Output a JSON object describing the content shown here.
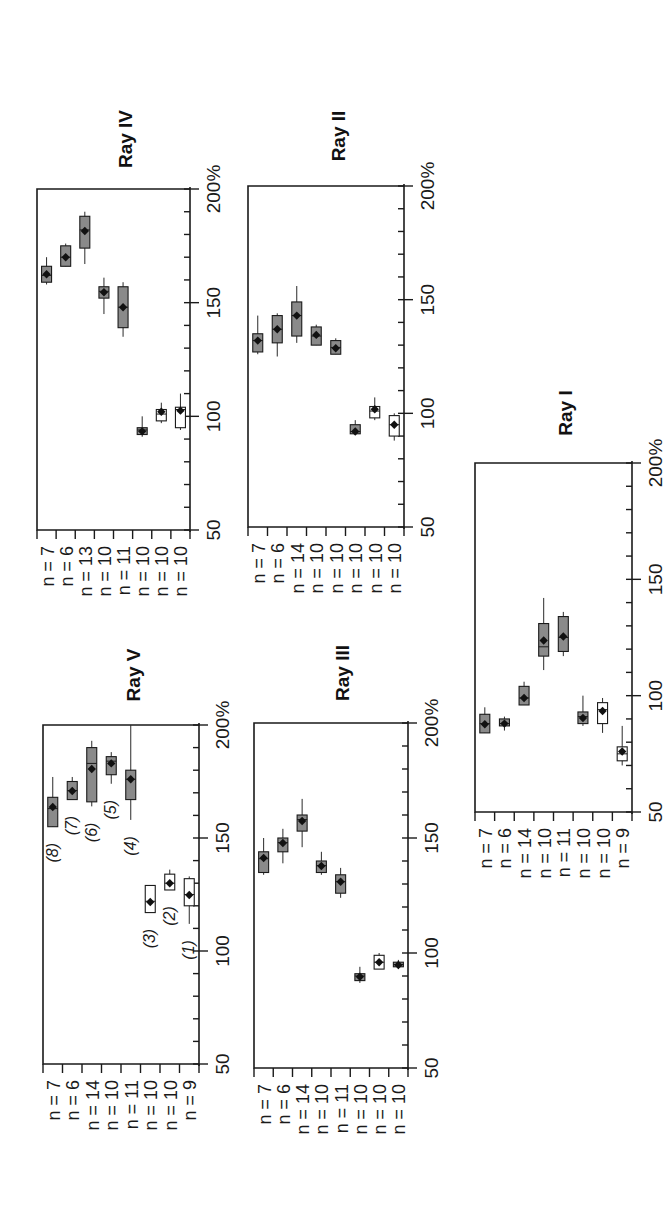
{
  "figure": {
    "orientation": "rotated 90 degrees counter-clockwise",
    "x_axis_ticks": [
      "50",
      "100",
      "150",
      "200%"
    ],
    "colors": {
      "dark_box": "#8a8a8a",
      "light_box": "#ffffff",
      "line": "#1a1a1a"
    }
  },
  "chart_data": [
    {
      "type": "box",
      "title": "Ray IV",
      "xlabel": "",
      "ylabel": "",
      "value_range": [
        50,
        200
      ],
      "value_ticks": [
        50,
        100,
        150,
        200
      ],
      "value_tick_labels": [
        "50",
        "100",
        "150",
        "200%"
      ],
      "minor_tick_step": 10,
      "categories": [
        "n = 7",
        "n = 6",
        "n = 13",
        "n = 10",
        "n = 11",
        "n = 10",
        "n = 10",
        "n = 10"
      ],
      "series": [
        {
          "n": 7,
          "min": 158,
          "q1": 159,
          "median": 162,
          "q3": 166,
          "max": 170,
          "mean": 162.5,
          "fill": "dark"
        },
        {
          "n": 6,
          "min": 166,
          "q1": 166,
          "median": 170,
          "q3": 175,
          "max": 176,
          "mean": 170,
          "fill": "dark"
        },
        {
          "n": 13,
          "min": 167,
          "q1": 174,
          "median": 182,
          "q3": 188,
          "max": 190,
          "mean": 181.5,
          "fill": "dark"
        },
        {
          "n": 10,
          "min": 145,
          "q1": 152,
          "median": 155,
          "q3": 157,
          "max": 161,
          "mean": 154.6,
          "fill": "dark"
        },
        {
          "n": 11,
          "min": 135,
          "q1": 139,
          "median": 148,
          "q3": 157,
          "max": 159,
          "mean": 148,
          "fill": "dark"
        },
        {
          "n": 10,
          "min": 91,
          "q1": 92,
          "median": 94,
          "q3": 95,
          "max": 100,
          "mean": 93.4,
          "fill": "dark"
        },
        {
          "n": 10,
          "min": 97,
          "q1": 98,
          "median": 101,
          "q3": 103,
          "max": 106,
          "mean": 102,
          "fill": "light"
        },
        {
          "n": 10,
          "min": 94,
          "q1": 95,
          "median": 103,
          "q3": 104,
          "max": 110,
          "mean": 102.5,
          "fill": "light"
        }
      ]
    },
    {
      "type": "box",
      "title": "Ray II",
      "value_range": [
        50,
        200
      ],
      "value_ticks": [
        50,
        100,
        150,
        200
      ],
      "value_tick_labels": [
        "50",
        "100",
        "150",
        "200%"
      ],
      "minor_tick_step": 10,
      "categories": [
        "n = 7",
        "n = 6",
        "n = 14",
        "n = 10",
        "n = 10",
        "n = 10",
        "n = 10",
        "n = 10"
      ],
      "series": [
        {
          "n": 7,
          "min": 126,
          "q1": 127,
          "median": 132,
          "q3": 135,
          "max": 143,
          "mean": 132,
          "fill": "dark"
        },
        {
          "n": 6,
          "min": 125,
          "q1": 131,
          "median": 137,
          "q3": 143,
          "max": 144,
          "mean": 137,
          "fill": "dark"
        },
        {
          "n": 14,
          "min": 131,
          "q1": 134,
          "median": 143,
          "q3": 149,
          "max": 156,
          "mean": 143,
          "fill": "dark"
        },
        {
          "n": 10,
          "min": 130,
          "q1": 130,
          "median": 134,
          "q3": 138,
          "max": 139,
          "mean": 134.5,
          "fill": "dark"
        },
        {
          "n": 10,
          "min": 126,
          "q1": 126,
          "median": 129,
          "q3": 132,
          "max": 133,
          "mean": 128.6,
          "fill": "dark"
        },
        {
          "n": 10,
          "min": 91,
          "q1": 91,
          "median": 92,
          "q3": 95,
          "max": 97,
          "mean": 92,
          "fill": "dark"
        },
        {
          "n": 10,
          "min": 97,
          "q1": 98,
          "median": 101,
          "q3": 103,
          "max": 107,
          "mean": 101.8,
          "fill": "light"
        },
        {
          "n": 10,
          "min": 88,
          "q1": 90,
          "median": 95,
          "q3": 99,
          "max": 100,
          "mean": 95,
          "fill": "light"
        }
      ]
    },
    {
      "type": "box",
      "title": "Ray V",
      "value_range": [
        50,
        200
      ],
      "value_ticks": [
        50,
        100,
        150,
        200
      ],
      "value_tick_labels": [
        "50",
        "100",
        "150",
        "200%"
      ],
      "minor_tick_step": 10,
      "categories": [
        "n = 7",
        "n = 6",
        "n = 14",
        "n = 10",
        "n = 11",
        "n = 10",
        "n = 10",
        "n = 9"
      ],
      "group_labels": [
        "(8)",
        "(7)",
        "(6)",
        "(5)",
        "(4)",
        "(3)",
        "(2)",
        "(1)"
      ],
      "series": [
        {
          "n": 7,
          "label": "(8)",
          "min": 155,
          "q1": 155,
          "median": 163,
          "q3": 168,
          "max": 177,
          "mean": 163.7,
          "fill": "dark"
        },
        {
          "n": 6,
          "label": "(7)",
          "min": 167,
          "q1": 167,
          "median": 171,
          "q3": 175,
          "max": 177,
          "mean": 170.8,
          "fill": "dark"
        },
        {
          "n": 14,
          "label": "(6)",
          "min": 164,
          "q1": 166,
          "median": 183,
          "q3": 190,
          "max": 193,
          "mean": 180.5,
          "fill": "dark"
        },
        {
          "n": 10,
          "label": "(5)",
          "min": 174,
          "q1": 178,
          "median": 184,
          "q3": 186,
          "max": 188,
          "mean": 183,
          "fill": "dark"
        },
        {
          "n": 11,
          "label": "(4)",
          "min": 158,
          "q1": 167,
          "median": 176,
          "q3": 180,
          "max": 200,
          "mean": 176,
          "fill": "dark"
        },
        {
          "n": 10,
          "label": "(3)",
          "min": 117,
          "q1": 117,
          "median": 122,
          "q3": 129,
          "max": 129,
          "mean": 121.7,
          "fill": "light"
        },
        {
          "n": 10,
          "label": "(2)",
          "min": 127,
          "q1": 127,
          "median": 130,
          "q3": 134,
          "max": 136,
          "mean": 130,
          "fill": "light"
        },
        {
          "n": 9,
          "label": "(1)",
          "min": 112,
          "q1": 120,
          "median": 125,
          "q3": 132,
          "max": 133,
          "mean": 124.8,
          "fill": "light"
        }
      ]
    },
    {
      "type": "box",
      "title": "Ray III",
      "value_range": [
        50,
        200
      ],
      "value_ticks": [
        50,
        100,
        150,
        200
      ],
      "value_tick_labels": [
        "50",
        "100",
        "150",
        "200%"
      ],
      "minor_tick_step": 10,
      "categories": [
        "n = 7",
        "n = 6",
        "n = 14",
        "n = 10",
        "n = 11",
        "n = 10",
        "n = 10",
        "n = 10"
      ],
      "series": [
        {
          "n": 7,
          "min": 134,
          "q1": 135,
          "median": 141,
          "q3": 144,
          "max": 150,
          "mean": 141.3,
          "fill": "dark"
        },
        {
          "n": 6,
          "min": 139,
          "q1": 144,
          "median": 148,
          "q3": 150,
          "max": 154,
          "mean": 147.8,
          "fill": "dark"
        },
        {
          "n": 14,
          "min": 146,
          "q1": 153,
          "median": 158,
          "q3": 160,
          "max": 167,
          "mean": 157.4,
          "fill": "dark"
        },
        {
          "n": 10,
          "min": 134,
          "q1": 135,
          "median": 138,
          "q3": 140,
          "max": 144,
          "mean": 137.8,
          "fill": "dark"
        },
        {
          "n": 11,
          "min": 124,
          "q1": 126,
          "median": 131,
          "q3": 134,
          "max": 137,
          "mean": 131,
          "fill": "dark"
        },
        {
          "n": 10,
          "min": 87,
          "q1": 88,
          "median": 90,
          "q3": 91,
          "max": 94,
          "mean": 89.7,
          "fill": "dark"
        },
        {
          "n": 10,
          "min": 94,
          "q1": 93,
          "median": 96,
          "q3": 99,
          "max": 100,
          "mean": 96,
          "fill": "light"
        },
        {
          "n": 10,
          "min": 93,
          "q1": 94,
          "median": 95,
          "q3": 96,
          "max": 97,
          "mean": 94.8,
          "fill": "dark"
        }
      ]
    },
    {
      "type": "box",
      "title": "Ray I",
      "value_range": [
        50,
        200
      ],
      "value_ticks": [
        50,
        100,
        150,
        200
      ],
      "value_tick_labels": [
        "50",
        "100",
        "150",
        "200%"
      ],
      "minor_tick_step": 10,
      "categories": [
        "n = 7",
        "n = 6",
        "n = 14",
        "n = 10",
        "n = 11",
        "n = 10",
        "n = 10",
        "n = 9"
      ],
      "series": [
        {
          "n": 7,
          "min": 84,
          "q1": 84,
          "median": 88,
          "q3": 92,
          "max": 95,
          "mean": 87.7,
          "fill": "dark"
        },
        {
          "n": 6,
          "min": 85,
          "q1": 87,
          "median": 88,
          "q3": 90,
          "max": 91,
          "mean": 88,
          "fill": "dark"
        },
        {
          "n": 14,
          "min": 96,
          "q1": 96,
          "median": 99,
          "q3": 104,
          "max": 106,
          "mean": 99,
          "fill": "dark"
        },
        {
          "n": 10,
          "min": 111,
          "q1": 117,
          "median": 121,
          "q3": 131,
          "max": 142,
          "mean": 123.7,
          "fill": "dark"
        },
        {
          "n": 11,
          "min": 117,
          "q1": 119,
          "median": 125,
          "q3": 134,
          "max": 136,
          "mean": 125.4,
          "fill": "dark"
        },
        {
          "n": 10,
          "min": 87,
          "q1": 88,
          "median": 91,
          "q3": 93,
          "max": 100,
          "mean": 90.4,
          "fill": "dark"
        },
        {
          "n": 10,
          "min": 84,
          "q1": 88,
          "median": 94,
          "q3": 97,
          "max": 99,
          "mean": 93.4,
          "fill": "light"
        },
        {
          "n": 9,
          "min": 70,
          "q1": 72,
          "median": 75,
          "q3": 78,
          "max": 87,
          "mean": 76,
          "fill": "light"
        }
      ]
    }
  ],
  "layout": {
    "panels": [
      {
        "x0": 37,
        "x1": 190,
        "y200": 189,
        "y50": 530
      },
      {
        "x0": 248,
        "x1": 404,
        "y200": 186,
        "y50": 527
      },
      {
        "x0": 43,
        "x1": 199,
        "y200": 725,
        "y50": 1064
      },
      {
        "x0": 254,
        "x1": 408,
        "y200": 723,
        "y50": 1068
      },
      {
        "x0": 475,
        "x1": 632,
        "y200": 463,
        "y50": 812
      }
    ]
  }
}
